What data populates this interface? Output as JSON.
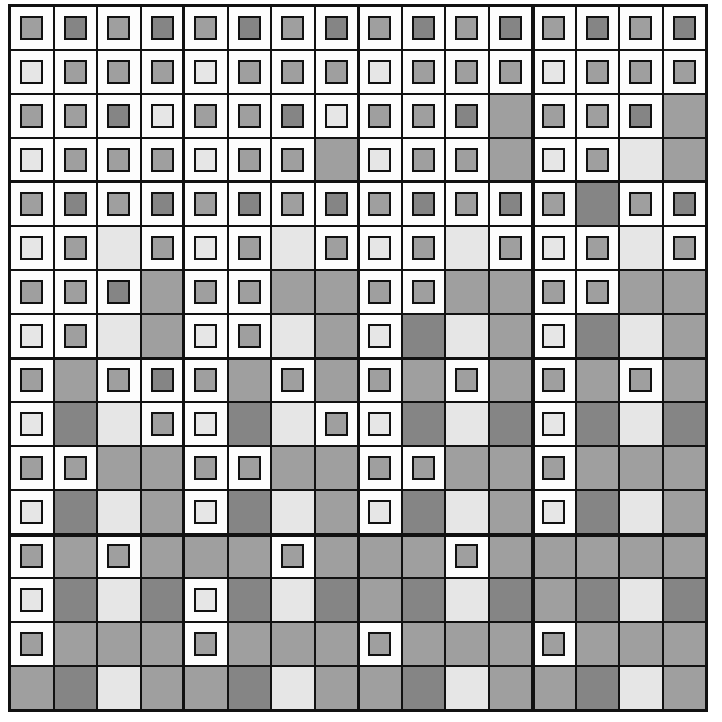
{
  "palette": {
    "L": "#e6e6e6",
    "M": "#9f9f9f",
    "D": "#858585",
    "W": "#fdfdfd",
    "line": "#111111"
  },
  "grid": {
    "rows": 16,
    "cols": 16,
    "legend": "F = white framed cell with inner colored square; S = solid colored cell; letter = color key",
    "cells": [
      [
        "FM",
        "FD",
        "FM",
        "FD",
        "FM",
        "FD",
        "FM",
        "FD",
        "FM",
        "FD",
        "FM",
        "FD",
        "FM",
        "FD",
        "FM",
        "FD"
      ],
      [
        "FL",
        "FM",
        "FM",
        "FM",
        "FL",
        "FM",
        "FM",
        "FM",
        "FL",
        "FM",
        "FM",
        "FM",
        "FL",
        "FM",
        "FM",
        "FM"
      ],
      [
        "FM",
        "FM",
        "FD",
        "FL",
        "FM",
        "FM",
        "FD",
        "FL",
        "FM",
        "FM",
        "FD",
        "SM",
        "FM",
        "FM",
        "FD",
        "SM"
      ],
      [
        "FL",
        "FM",
        "FM",
        "FM",
        "FL",
        "FM",
        "FM",
        "SM",
        "FL",
        "FM",
        "FM",
        "SM",
        "FL",
        "FM",
        "SL",
        "SM"
      ],
      [
        "FM",
        "FD",
        "FM",
        "FD",
        "FM",
        "FD",
        "FM",
        "FD",
        "FM",
        "FD",
        "FM",
        "FD",
        "FM",
        "SD",
        "FM",
        "FD"
      ],
      [
        "FL",
        "FM",
        "SL",
        "FM",
        "FL",
        "FM",
        "SL",
        "FM",
        "FL",
        "FM",
        "SL",
        "FM",
        "FL",
        "FM",
        "SL",
        "FM"
      ],
      [
        "FM",
        "FM",
        "FD",
        "SM",
        "FM",
        "FM",
        "SM",
        "SM",
        "FM",
        "FM",
        "SM",
        "SM",
        "FM",
        "FM",
        "SM",
        "SM"
      ],
      [
        "FL",
        "FM",
        "SL",
        "SM",
        "FL",
        "FM",
        "SL",
        "SM",
        "FL",
        "SD",
        "SL",
        "SM",
        "FL",
        "SD",
        "SL",
        "SM"
      ],
      [
        "FM",
        "SM",
        "FM",
        "FD",
        "FM",
        "SM",
        "FM",
        "SM",
        "FM",
        "SM",
        "FM",
        "SM",
        "FM",
        "SM",
        "FM",
        "SM"
      ],
      [
        "FL",
        "SD",
        "SL",
        "FM",
        "FL",
        "SD",
        "SL",
        "FM",
        "FL",
        "SD",
        "SL",
        "SD",
        "FL",
        "SD",
        "SL",
        "SD"
      ],
      [
        "FM",
        "FM",
        "SM",
        "SM",
        "FM",
        "FM",
        "SM",
        "SM",
        "FM",
        "FM",
        "SM",
        "SM",
        "FM",
        "SM",
        "SM",
        "SM"
      ],
      [
        "FL",
        "SD",
        "SL",
        "SM",
        "FL",
        "SD",
        "SL",
        "SM",
        "FL",
        "SD",
        "SL",
        "SM",
        "FL",
        "SD",
        "SL",
        "SM"
      ],
      [
        "FM",
        "SM",
        "FM",
        "SM",
        "SM",
        "SM",
        "FM",
        "SM",
        "SM",
        "SM",
        "FM",
        "SM",
        "SM",
        "SM",
        "SM",
        "SM"
      ],
      [
        "FL",
        "SD",
        "SL",
        "SD",
        "FL",
        "SD",
        "SL",
        "SD",
        "SM",
        "SD",
        "SL",
        "SD",
        "SM",
        "SD",
        "SL",
        "SD"
      ],
      [
        "FM",
        "SM",
        "SM",
        "SM",
        "FM",
        "SM",
        "SM",
        "SM",
        "FM",
        "SM",
        "SM",
        "SM",
        "FM",
        "SM",
        "SM",
        "SM"
      ],
      [
        "SM",
        "SD",
        "SL",
        "SM",
        "SM",
        "SD",
        "SL",
        "SM",
        "SM",
        "SD",
        "SL",
        "SM",
        "SM",
        "SD",
        "SL",
        "SM"
      ]
    ]
  }
}
